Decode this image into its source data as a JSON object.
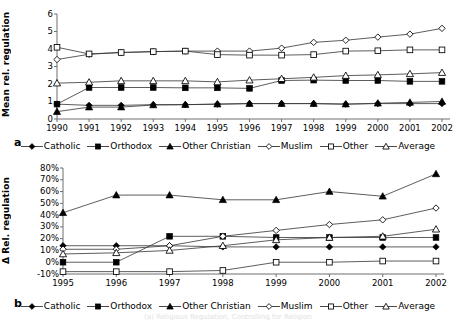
{
  "figure": {
    "panel_a_label": "a",
    "panel_b_label": "b",
    "caption_partial": "(a) Religious Regulation, Controlling for Religion"
  },
  "legend": {
    "items": [
      {
        "label": "Catholic",
        "marker": "filled-diamond",
        "color": "#000000"
      },
      {
        "label": "Orthodox",
        "marker": "filled-square",
        "color": "#000000"
      },
      {
        "label": "Other Christian",
        "marker": "filled-triangle",
        "color": "#000000"
      },
      {
        "label": "Muslim",
        "marker": "open-diamond",
        "color": "#000000"
      },
      {
        "label": "Other",
        "marker": "open-square",
        "color": "#000000"
      },
      {
        "label": "Average",
        "marker": "open-triangle",
        "color": "#000000"
      }
    ]
  },
  "chart_data": [
    {
      "type": "line",
      "panel": "a",
      "title": "",
      "xlabel": "",
      "ylabel": "Mean rel. regulation",
      "grid": false,
      "legend_position": "bottom",
      "categories": [
        "1990",
        "1991",
        "1992",
        "1993",
        "1994",
        "1995",
        "1996",
        "1997",
        "1998",
        "1999",
        "2000",
        "2001",
        "2002"
      ],
      "ylim": [
        0,
        6
      ],
      "yticks": [
        "0",
        "1",
        "2",
        "3",
        "4",
        "5",
        "6"
      ],
      "series": [
        {
          "name": "Catholic",
          "marker": "filled-diamond",
          "values": [
            0.85,
            0.78,
            0.78,
            0.82,
            0.82,
            0.85,
            0.88,
            0.88,
            0.88,
            0.85,
            0.88,
            0.88,
            0.88
          ]
        },
        {
          "name": "Orthodox",
          "marker": "filled-square",
          "values": [
            0.85,
            1.8,
            1.8,
            1.8,
            1.78,
            1.78,
            1.75,
            2.2,
            2.22,
            2.2,
            2.2,
            2.15,
            2.15
          ]
        },
        {
          "name": "Other Christian",
          "marker": "filled-triangle",
          "values": [
            0.42,
            0.68,
            0.68,
            0.8,
            0.82,
            0.85,
            0.88,
            0.88,
            0.88,
            0.85,
            0.9,
            0.95,
            1.0
          ]
        },
        {
          "name": "Muslim",
          "marker": "open-diamond",
          "values": [
            3.4,
            3.7,
            3.8,
            3.85,
            3.88,
            3.88,
            3.88,
            4.05,
            4.38,
            4.5,
            4.68,
            4.85,
            5.18
          ]
        },
        {
          "name": "Other",
          "marker": "open-square",
          "values": [
            4.1,
            3.72,
            3.8,
            3.85,
            3.88,
            3.68,
            3.65,
            3.65,
            3.68,
            3.88,
            3.9,
            3.95,
            3.95
          ]
        },
        {
          "name": "Average",
          "marker": "open-triangle",
          "values": [
            2.05,
            2.1,
            2.18,
            2.18,
            2.18,
            2.12,
            2.22,
            2.3,
            2.38,
            2.48,
            2.52,
            2.58,
            2.65
          ]
        }
      ]
    },
    {
      "type": "line",
      "panel": "b",
      "title": "",
      "xlabel": "",
      "ylabel": "Δ Rel. regulation",
      "grid": false,
      "legend_position": "bottom",
      "categories": [
        "1995",
        "1996",
        "1997",
        "1998",
        "1999",
        "2000",
        "2001",
        "2002"
      ],
      "ylim": [
        -10,
        80
      ],
      "yticks": [
        "-10%",
        "0%",
        "10%",
        "20%",
        "30%",
        "40%",
        "50%",
        "60%",
        "70%",
        "80%"
      ],
      "series": [
        {
          "name": "Catholic",
          "marker": "filled-diamond",
          "values": [
            14,
            14,
            14,
            13,
            13,
            13,
            13,
            13
          ]
        },
        {
          "name": "Orthodox",
          "marker": "filled-square",
          "values": [
            0,
            0,
            22,
            22,
            21,
            21,
            21,
            21
          ]
        },
        {
          "name": "Other Christian",
          "marker": "filled-triangle",
          "values": [
            42,
            57,
            57,
            53,
            53,
            60,
            56,
            75
          ]
        },
        {
          "name": "Muslim",
          "marker": "open-diamond",
          "values": [
            11,
            11,
            14,
            22,
            27,
            32,
            36,
            46
          ]
        },
        {
          "name": "Other",
          "marker": "open-square",
          "values": [
            -8,
            -8,
            -8,
            -7,
            0,
            0,
            1,
            1
          ]
        },
        {
          "name": "Average",
          "marker": "open-triangle",
          "values": [
            7,
            8,
            10,
            14,
            19,
            21,
            22,
            28
          ]
        }
      ]
    }
  ]
}
